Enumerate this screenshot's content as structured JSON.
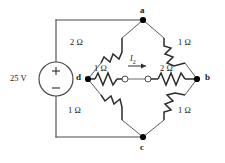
{
  "figure": {
    "type": "electrical-circuit-schematic",
    "line_color": "#2b2b2b",
    "node_color": "#000000",
    "background": "#ffffff"
  },
  "source": {
    "name": "voltage-source",
    "label": "25 V",
    "plus": "+",
    "minus": "−"
  },
  "nodes": [
    {
      "id": "a",
      "label": "a",
      "x": 143,
      "y": 20
    },
    {
      "id": "b",
      "label": "b",
      "x": 197,
      "y": 79
    },
    {
      "id": "c",
      "label": "c",
      "x": 143,
      "y": 137
    },
    {
      "id": "d",
      "label": "d",
      "x": 88,
      "y": 79
    }
  ],
  "resistors": [
    {
      "name": "resistor-d-a",
      "label": "2 Ω",
      "between": "d-a"
    },
    {
      "name": "resistor-a-b",
      "label": "1 Ω",
      "between": "a-b"
    },
    {
      "name": "resistor-d-center",
      "label": "1 Ω",
      "between": "d-center"
    },
    {
      "name": "resistor-center-b",
      "label": "2 Ω",
      "between": "center-b"
    },
    {
      "name": "resistor-d-c",
      "label": "1 Ω",
      "between": "d-c"
    },
    {
      "name": "resistor-c-b",
      "label": "1 Ω",
      "between": "c-b"
    }
  ],
  "current": {
    "name": "current-i2",
    "symbol": "I",
    "subscript": "2",
    "direction": "right"
  },
  "terminals": {
    "left_terminal": "open-terminal-left",
    "right_terminal": "open-terminal-right"
  }
}
